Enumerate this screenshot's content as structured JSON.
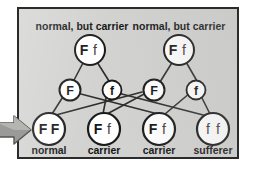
{
  "diagram": {
    "title_hidden": "",
    "parent_labels": [
      {
        "id": "parent-label-left",
        "text": "normal, but carrier",
        "x": 80,
        "y": 22
      },
      {
        "id": "parent-label-right",
        "text": "normal, but carrier",
        "x": 177,
        "y": 22
      }
    ],
    "parents": [
      {
        "id": "parent-left",
        "genotype": "Ff",
        "dominant": "F",
        "recessive": "f",
        "x": 88,
        "y": 48,
        "r": 15
      },
      {
        "id": "parent-right",
        "genotype": "Ff",
        "dominant": "F",
        "recessive": "f",
        "x": 177,
        "y": 48,
        "r": 15
      }
    ],
    "gametes": [
      {
        "id": "gamete-1",
        "allele": "F",
        "bold": true,
        "x": 68,
        "y": 88,
        "r": 10.5
      },
      {
        "id": "gamete-2",
        "allele": "f",
        "bold": false,
        "x": 110,
        "y": 88,
        "r": 9.5
      },
      {
        "id": "gamete-3",
        "allele": "F",
        "bold": true,
        "x": 152,
        "y": 88,
        "r": 10.5
      },
      {
        "id": "gamete-4",
        "allele": "f",
        "bold": false,
        "x": 194,
        "y": 88,
        "r": 9.5
      }
    ],
    "offspring": [
      {
        "id": "offspring-1",
        "genotype": "FF",
        "dominant": "F",
        "recessive": "F",
        "caption": "normal",
        "x": 47,
        "y": 127,
        "r": 16
      },
      {
        "id": "offspring-2",
        "genotype": "Ff",
        "dominant": "F",
        "recessive": "f",
        "caption": "carrier",
        "x": 102,
        "y": 127,
        "r": 16
      },
      {
        "id": "offspring-3",
        "genotype": "Ff",
        "dominant": "F",
        "recessive": "f",
        "caption": "carrier",
        "x": 157,
        "y": 127,
        "r": 16
      },
      {
        "id": "offspring-4",
        "genotype": "ff",
        "dominant": "f",
        "recessive": "f",
        "caption": "sufferer",
        "x": 211,
        "y": 127,
        "r": 16
      }
    ],
    "captions": [
      {
        "id": "caption-1",
        "text": "normal",
        "x": 47,
        "y": 152
      },
      {
        "id": "caption-2",
        "text": "carrier",
        "x": 102,
        "y": 152
      },
      {
        "id": "caption-3",
        "text": "carrier",
        "x": 157,
        "y": 152
      },
      {
        "id": "caption-4",
        "text": "sufferer",
        "x": 211,
        "y": 152
      }
    ],
    "edges": [
      {
        "id": "edge-parentL-F",
        "from": "parent-left",
        "to": "gamete-1"
      },
      {
        "id": "edge-parentL-f",
        "from": "parent-left",
        "to": "gamete-2"
      },
      {
        "id": "edge-parentR-F",
        "from": "parent-right",
        "to": "gamete-3"
      },
      {
        "id": "edge-parentR-f",
        "from": "parent-right",
        "to": "gamete-4"
      },
      {
        "id": "edge-F1-FF",
        "from": "gamete-1",
        "to": "offspring-1"
      },
      {
        "id": "edge-F1-Ff2",
        "from": "gamete-1",
        "to": "offspring-2"
      },
      {
        "id": "edge-f2-Ff3",
        "from": "gamete-2",
        "to": "offspring-3"
      },
      {
        "id": "edge-f2-ff4",
        "from": "gamete-2",
        "to": "offspring-4"
      },
      {
        "id": "edge-F3-FF",
        "from": "gamete-3",
        "to": "offspring-1"
      },
      {
        "id": "edge-F3-Ff2",
        "from": "gamete-3",
        "to": "offspring-2"
      },
      {
        "id": "edge-f4-Ff3",
        "from": "gamete-4",
        "to": "offspring-3"
      },
      {
        "id": "edge-f4-ff4",
        "from": "gamete-4",
        "to": "offspring-4"
      }
    ],
    "pointer": {
      "id": "left-arrow",
      "name": "arrow-right-icon",
      "direction": "right",
      "points_at": "offspring-1"
    },
    "colors": {
      "panel_background": "#d2d2d0",
      "panel_border": "#2b2b2b",
      "node_fill": "#ffffff",
      "node_stroke": "#1a1a1a",
      "edge_stroke": "#2d2d2d",
      "text": "#151515",
      "arrow_fill": "#9a9a98",
      "arrow_stroke": "#4a4a48",
      "page_background": "#ffffff"
    }
  }
}
